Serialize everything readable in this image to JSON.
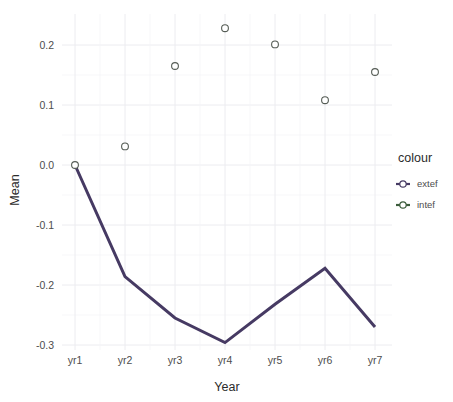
{
  "chart_data": {
    "type": "line",
    "title": "",
    "subtitle": "",
    "xlabel": "Year",
    "ylabel": "Mean",
    "categories": [
      "yr1",
      "yr2",
      "yr3",
      "yr4",
      "yr5",
      "yr6",
      "yr7"
    ],
    "x_tick_labels": [
      "yr1",
      "yr2",
      "yr3",
      "yr4",
      "yr5",
      "yr6",
      "yr7"
    ],
    "y_tick_labels": [
      "0.2",
      "0.1",
      "0.0",
      "-0.1",
      "-0.2",
      "-0.3"
    ],
    "y_tick_values": [
      0.2,
      0.1,
      0.0,
      -0.1,
      -0.2,
      -0.3
    ],
    "ylim": [
      -0.32,
      0.245
    ],
    "grid": true,
    "legend_position": "right",
    "legend_title": "colour",
    "series": [
      {
        "name": "extef",
        "render": "line",
        "color": "#463a63",
        "values": [
          0.0,
          -0.186,
          -0.255,
          -0.296,
          -0.232,
          -0.172,
          -0.27
        ]
      },
      {
        "name": "intef",
        "render": "points",
        "color": "#3c5c3c",
        "values": [
          0.0,
          0.031,
          0.165,
          0.228,
          0.201,
          0.108,
          0.155
        ]
      }
    ]
  },
  "axes": {
    "x_title": "Year",
    "y_title": "Mean"
  },
  "legend": {
    "title": "colour",
    "entries": [
      {
        "label": "extef",
        "color": "#463a63"
      },
      {
        "label": "intef",
        "color": "#3c5c3c"
      }
    ]
  },
  "colors": {
    "extef": "#463a63",
    "intef": "#3c5c3c",
    "panel_background": "#ffffff",
    "grid_major": "#ececf0",
    "grid_minor": "#f5f5f7",
    "text": "#4d4d4d"
  }
}
